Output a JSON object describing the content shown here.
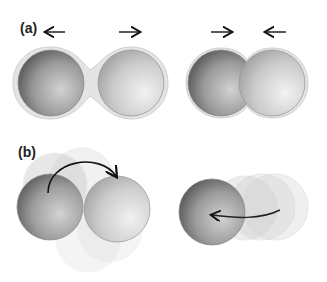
{
  "panels": [
    {
      "id": "a",
      "label": "(a)"
    },
    {
      "id": "b",
      "label": "(b)"
    }
  ],
  "colors": {
    "sphere_dark": "#6e6e6e",
    "sphere_light": "#cfcfcf",
    "shell": "#e6e6e6",
    "arrow": "#111111"
  }
}
